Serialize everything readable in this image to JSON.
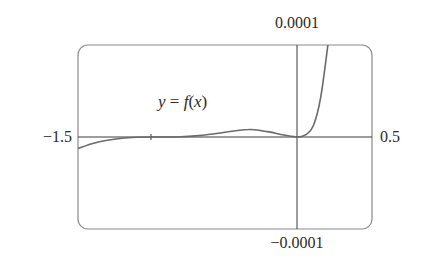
{
  "chart_data": {
    "type": "line",
    "title": "",
    "xlabel": "",
    "ylabel": "",
    "curve_label": "y = f(x)",
    "curve_label_parts": {
      "y": "y",
      "eq": " = ",
      "f": "f",
      "open": "(",
      "x": "x",
      "close": ")"
    },
    "xlim": [
      -1.5,
      0.5
    ],
    "ylim": [
      -0.0001,
      0.0001
    ],
    "x_tick_labels": {
      "left": "−1.5",
      "right": "0.5"
    },
    "y_tick_labels": {
      "top": "0.0001",
      "bottom": "−0.0001"
    },
    "grid": false,
    "legend": "none",
    "series": [
      {
        "name": "y = f(x)",
        "x": [
          -1.5,
          -1.4,
          -1.3,
          -1.2,
          -1.1,
          -1.0,
          -0.9,
          -0.8,
          -0.7,
          -0.6,
          -0.5,
          -0.4,
          -0.34,
          -0.3,
          -0.2,
          -0.1,
          0.0,
          0.05,
          0.1,
          0.15,
          0.2
        ],
        "y": [
          -1.25e-05,
          -7e-06,
          -3.5e-06,
          -1.3e-06,
          -3e-07,
          0.0,
          0.0,
          2e-07,
          1.2e-06,
          3e-06,
          5.2e-06,
          7.4e-06,
          8.2e-06,
          7.9e-06,
          5.5e-06,
          2.2e-06,
          0.0,
          2.5e-06,
          1.2e-05,
          4.2e-05,
          0.0001
        ]
      }
    ],
    "annotations": [
      {
        "text": "y = f(x)",
        "x": -0.95,
        "y": 2.7e-05
      }
    ],
    "colors": {
      "curve": "#6a6a6a",
      "axes": "#3a3a3a",
      "frame": "#8a8a8a",
      "text": "#2a2a2a"
    }
  }
}
